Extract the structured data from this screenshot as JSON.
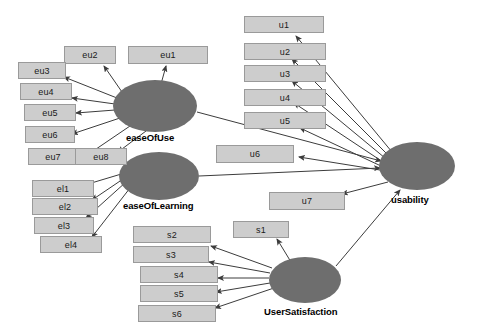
{
  "diagram": {
    "type": "sem-path-diagram",
    "background_color": "#ffffff",
    "indicator_fill": "#cdcdcd",
    "indicator_border": "#9a9a9a",
    "latent_fill": "#6e6e6e",
    "edge_color": "#3c3c3c"
  },
  "latents": [
    {
      "id": "easeOfUse",
      "label": "easeOfUse",
      "cx": 155,
      "cy": 106,
      "rx": 42,
      "ry": 26,
      "label_x": 126,
      "label_y": 132
    },
    {
      "id": "easeOfLearning",
      "label": "easeOfLearning",
      "cx": 159,
      "cy": 176,
      "rx": 40,
      "ry": 24,
      "label_x": 123,
      "label_y": 200
    },
    {
      "id": "usability",
      "label": "usability",
      "cx": 417,
      "cy": 166,
      "rx": 38,
      "ry": 24,
      "label_x": 391,
      "label_y": 194
    },
    {
      "id": "UserSatisfaction",
      "label": "UserSatisfaction",
      "cx": 305,
      "cy": 280,
      "rx": 36,
      "ry": 23,
      "label_x": 264,
      "label_y": 306
    }
  ],
  "indicators": [
    {
      "id": "eu1",
      "label": "eu1",
      "x": 128,
      "y": 46,
      "w": 80,
      "h": 18,
      "parent": "easeOfUse"
    },
    {
      "id": "eu2",
      "label": "eu2",
      "x": 64,
      "y": 46,
      "w": 52,
      "h": 18,
      "parent": "easeOfUse"
    },
    {
      "id": "eu3",
      "label": "eu3",
      "x": 18,
      "y": 62,
      "w": 48,
      "h": 17,
      "parent": "easeOfUse"
    },
    {
      "id": "eu4",
      "label": "eu4",
      "x": 20,
      "y": 83,
      "w": 52,
      "h": 17,
      "parent": "easeOfUse"
    },
    {
      "id": "eu5",
      "label": "eu5",
      "x": 24,
      "y": 104,
      "w": 52,
      "h": 17,
      "parent": "easeOfUse"
    },
    {
      "id": "eu6",
      "label": "eu6",
      "x": 25,
      "y": 126,
      "w": 50,
      "h": 17,
      "parent": "easeOfUse"
    },
    {
      "id": "eu7",
      "label": "eu7",
      "x": 28,
      "y": 148,
      "w": 50,
      "h": 17,
      "parent": "easeOfUse"
    },
    {
      "id": "eu8",
      "label": "eu8",
      "x": 75,
      "y": 148,
      "w": 52,
      "h": 17,
      "parent": "easeOfUse"
    },
    {
      "id": "el1",
      "label": "el1",
      "x": 32,
      "y": 180,
      "w": 62,
      "h": 17,
      "parent": "easeOfLearning"
    },
    {
      "id": "el2",
      "label": "el2",
      "x": 32,
      "y": 198,
      "w": 66,
      "h": 17,
      "parent": "easeOfLearning"
    },
    {
      "id": "el3",
      "label": "el3",
      "x": 34,
      "y": 217,
      "w": 60,
      "h": 17,
      "parent": "easeOfLearning"
    },
    {
      "id": "el4",
      "label": "el4",
      "x": 40,
      "y": 236,
      "w": 62,
      "h": 17,
      "parent": "easeOfLearning"
    },
    {
      "id": "u1",
      "label": "u1",
      "x": 244,
      "y": 16,
      "w": 80,
      "h": 17,
      "parent": "usability"
    },
    {
      "id": "u2",
      "label": "u2",
      "x": 244,
      "y": 43,
      "w": 82,
      "h": 17,
      "parent": "usability"
    },
    {
      "id": "u3",
      "label": "u3",
      "x": 244,
      "y": 65,
      "w": 82,
      "h": 17,
      "parent": "usability"
    },
    {
      "id": "u4",
      "label": "u4",
      "x": 244,
      "y": 89,
      "w": 82,
      "h": 17,
      "parent": "usability"
    },
    {
      "id": "u5",
      "label": "u5",
      "x": 244,
      "y": 112,
      "w": 82,
      "h": 17,
      "parent": "usability"
    },
    {
      "id": "u6",
      "label": "u6",
      "x": 216,
      "y": 145,
      "w": 78,
      "h": 18,
      "parent": "usability"
    },
    {
      "id": "u7",
      "label": "u7",
      "x": 269,
      "y": 192,
      "w": 76,
      "h": 18,
      "parent": "usability"
    },
    {
      "id": "s1",
      "label": "s1",
      "x": 233,
      "y": 221,
      "w": 56,
      "h": 17,
      "parent": "UserSatisfaction"
    },
    {
      "id": "s2",
      "label": "s2",
      "x": 133,
      "y": 226,
      "w": 78,
      "h": 17,
      "parent": "UserSatisfaction"
    },
    {
      "id": "s3",
      "label": "s3",
      "x": 133,
      "y": 246,
      "w": 76,
      "h": 17,
      "parent": "UserSatisfaction"
    },
    {
      "id": "s4",
      "label": "s4",
      "x": 140,
      "y": 266,
      "w": 78,
      "h": 17,
      "parent": "UserSatisfaction"
    },
    {
      "id": "s5",
      "label": "s5",
      "x": 140,
      "y": 285,
      "w": 78,
      "h": 17,
      "parent": "UserSatisfaction"
    },
    {
      "id": "s6",
      "label": "s6",
      "x": 138,
      "y": 305,
      "w": 78,
      "h": 17,
      "parent": "UserSatisfaction"
    }
  ],
  "measurement_edges": [
    {
      "from": "easeOfUse",
      "to": "eu1",
      "x1": 161,
      "y1": 84,
      "x2": 166,
      "y2": 66
    },
    {
      "from": "easeOfUse",
      "to": "eu2",
      "x1": 122,
      "y1": 92,
      "x2": 104,
      "y2": 66
    },
    {
      "from": "easeOfUse",
      "to": "eu3",
      "x1": 117,
      "y1": 98,
      "x2": 64,
      "y2": 77
    },
    {
      "from": "easeOfUse",
      "to": "eu4",
      "x1": 115,
      "y1": 104,
      "x2": 72,
      "y2": 98
    },
    {
      "from": "easeOfUse",
      "to": "eu5",
      "x1": 115,
      "y1": 110,
      "x2": 76,
      "y2": 113
    },
    {
      "from": "easeOfUse",
      "to": "eu6",
      "x1": 120,
      "y1": 118,
      "x2": 72,
      "y2": 134
    },
    {
      "from": "easeOfUse",
      "to": "eu7",
      "x1": 130,
      "y1": 126,
      "x2": 77,
      "y2": 162
    },
    {
      "from": "easeOfUse",
      "to": "eu8",
      "x1": 146,
      "y1": 131,
      "x2": 118,
      "y2": 152
    },
    {
      "from": "easeOfLearning",
      "to": "el1",
      "x1": 128,
      "y1": 172,
      "x2": 88,
      "y2": 184
    },
    {
      "from": "easeOfLearning",
      "to": "el2",
      "x1": 126,
      "y1": 177,
      "x2": 92,
      "y2": 200
    },
    {
      "from": "easeOfLearning",
      "to": "el3",
      "x1": 126,
      "y1": 182,
      "x2": 86,
      "y2": 218
    },
    {
      "from": "easeOfLearning",
      "to": "el4",
      "x1": 130,
      "y1": 188,
      "x2": 92,
      "y2": 237
    },
    {
      "from": "usability",
      "to": "u1",
      "x1": 392,
      "y1": 152,
      "x2": 296,
      "y2": 36
    },
    {
      "from": "usability",
      "to": "u2",
      "x1": 388,
      "y1": 155,
      "x2": 292,
      "y2": 59
    },
    {
      "from": "usability",
      "to": "u3",
      "x1": 385,
      "y1": 158,
      "x2": 292,
      "y2": 81
    },
    {
      "from": "usability",
      "to": "u4",
      "x1": 383,
      "y1": 162,
      "x2": 294,
      "y2": 103
    },
    {
      "from": "usability",
      "to": "u5",
      "x1": 381,
      "y1": 166,
      "x2": 300,
      "y2": 128
    },
    {
      "from": "usability",
      "to": "u6",
      "x1": 380,
      "y1": 170,
      "x2": 299,
      "y2": 157
    },
    {
      "from": "usability",
      "to": "u7",
      "x1": 388,
      "y1": 182,
      "x2": 342,
      "y2": 194
    },
    {
      "from": "UserSatisfaction",
      "to": "s1",
      "x1": 291,
      "y1": 262,
      "x2": 277,
      "y2": 239
    },
    {
      "from": "UserSatisfaction",
      "to": "s2",
      "x1": 272,
      "y1": 268,
      "x2": 211,
      "y2": 246
    },
    {
      "from": "UserSatisfaction",
      "to": "s3",
      "x1": 270,
      "y1": 273,
      "x2": 209,
      "y2": 262
    },
    {
      "from": "UserSatisfaction",
      "to": "s4",
      "x1": 269,
      "y1": 278,
      "x2": 218,
      "y2": 278
    },
    {
      "from": "UserSatisfaction",
      "to": "s5",
      "x1": 270,
      "y1": 283,
      "x2": 216,
      "y2": 292
    },
    {
      "from": "UserSatisfaction",
      "to": "s6",
      "x1": 274,
      "y1": 288,
      "x2": 215,
      "y2": 308
    }
  ],
  "structural_edges": [
    {
      "from": "easeOfUse",
      "to": "usability",
      "x1": 197,
      "y1": 112,
      "x2": 381,
      "y2": 161
    },
    {
      "from": "easeOfLearning",
      "to": "usability",
      "x1": 199,
      "y1": 176,
      "x2": 380,
      "y2": 168
    },
    {
      "from": "UserSatisfaction",
      "to": "usability",
      "x1": 336,
      "y1": 266,
      "x2": 400,
      "y2": 190
    }
  ]
}
